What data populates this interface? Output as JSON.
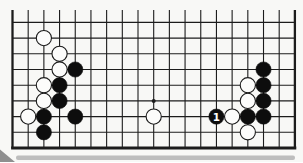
{
  "diagram": {
    "kind": "go-board-bottom-edge",
    "board_columns": 19,
    "visible_rows": 9,
    "star_points": [
      {
        "col": 10,
        "row": 6
      }
    ],
    "white_stones": [
      {
        "col": 3,
        "row": 2
      },
      {
        "col": 4,
        "row": 3
      },
      {
        "col": 4,
        "row": 4
      },
      {
        "col": 3,
        "row": 5
      },
      {
        "col": 3,
        "row": 6
      },
      {
        "col": 2,
        "row": 7
      },
      {
        "col": 10,
        "row": 7
      },
      {
        "col": 15,
        "row": 7
      },
      {
        "col": 16,
        "row": 5
      },
      {
        "col": 16,
        "row": 6
      },
      {
        "col": 16,
        "row": 8
      }
    ],
    "black_stones": [
      {
        "col": 5,
        "row": 4
      },
      {
        "col": 4,
        "row": 5
      },
      {
        "col": 4,
        "row": 6
      },
      {
        "col": 3,
        "row": 7
      },
      {
        "col": 5,
        "row": 7
      },
      {
        "col": 3,
        "row": 8
      },
      {
        "col": 16,
        "row": 7
      },
      {
        "col": 17,
        "row": 4
      },
      {
        "col": 17,
        "row": 5
      },
      {
        "col": 17,
        "row": 6
      },
      {
        "col": 17,
        "row": 7
      }
    ],
    "labeled_stones": [
      {
        "col": 14,
        "row": 7,
        "color": "black",
        "label": "1"
      }
    ],
    "colors": {
      "background": "#f8f8f6",
      "line": "#1c1c1c",
      "black_stone": "#0d0d0d",
      "white_stone_fill": "#fcfcfb",
      "white_stone_outline": "#1a1a1a",
      "label_text": "#ffffff",
      "shadow_band": "#b3b3b3",
      "corner_fold": "#8f8f8f"
    }
  }
}
